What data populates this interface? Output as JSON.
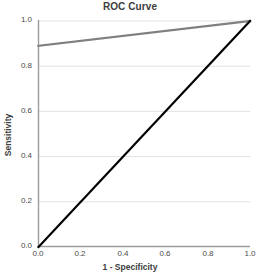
{
  "chart_data": {
    "type": "line",
    "title": "ROC Curve",
    "xlabel": "1 - Specificity",
    "ylabel": "Sensitivity",
    "xlim": [
      0.0,
      1.0
    ],
    "ylim": [
      0.0,
      1.0
    ],
    "grid": "horizontal",
    "legend": "none",
    "xticks": [
      "0.0",
      "0.2",
      "0.4",
      "0.6",
      "0.8",
      "1.0"
    ],
    "yticks": [
      "0.0",
      "0.2",
      "0.4",
      "0.6",
      "0.8",
      "1.0"
    ],
    "xtick_values": [
      0.0,
      0.2,
      0.4,
      0.6,
      0.8,
      1.0
    ],
    "ytick_values": [
      0.0,
      0.2,
      0.4,
      0.6,
      0.8,
      1.0
    ],
    "series": [
      {
        "name": "ROC Curve",
        "color": "#808080",
        "width": 2.2,
        "x": [
          0.0,
          1.0
        ],
        "values": [
          0.89,
          1.0
        ]
      },
      {
        "name": "Reference Line",
        "color": "#000000",
        "width": 2.2,
        "x": [
          0.0,
          1.0
        ],
        "values": [
          0.0,
          1.0
        ]
      }
    ],
    "colors": {
      "roc_line": "#808080",
      "reference_line": "#000000",
      "gridline": "#e2e2e2",
      "axis": "#9a9a9a",
      "background": "#ffffff",
      "text": "#3d3d3d"
    }
  }
}
